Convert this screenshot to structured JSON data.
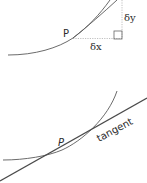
{
  "diagram": {
    "top": {
      "point_label": "P",
      "dy_label": "δy",
      "dx_label": "δx"
    },
    "bottom": {
      "point_label": "P",
      "tangent_label": "tangent"
    },
    "colors": {
      "line": "#555555",
      "dotted": "#aaaaaa",
      "text": "#2b2b2b"
    }
  }
}
